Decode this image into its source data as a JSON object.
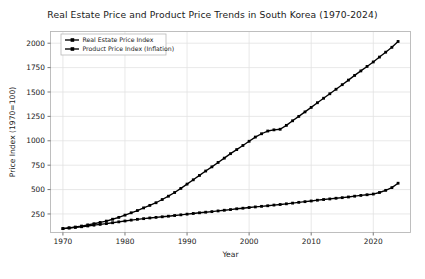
{
  "chart_data": {
    "type": "line",
    "title": "Real Estate Price and Product Price Trends in South Korea (1970-2024)",
    "xlabel": "Year",
    "ylabel": "Price Index (1970=100)",
    "xlim": [
      1968,
      2026
    ],
    "ylim": [
      60,
      2120
    ],
    "grid": true,
    "legend_position": "upper left",
    "xticks": [
      1970,
      1980,
      1990,
      2000,
      2010,
      2020
    ],
    "xtick_labels": [
      "1970",
      "1980",
      "1990",
      "2000",
      "2010",
      "2020"
    ],
    "yticks": [
      250,
      500,
      750,
      1000,
      1250,
      1500,
      1750,
      2000
    ],
    "ytick_labels": [
      "250",
      "500",
      "750",
      "1000",
      "1250",
      "1500",
      "1750",
      "2000"
    ],
    "x": [
      1970,
      1971,
      1972,
      1973,
      1974,
      1975,
      1976,
      1977,
      1978,
      1979,
      1980,
      1981,
      1982,
      1983,
      1984,
      1985,
      1986,
      1987,
      1988,
      1989,
      1990,
      1991,
      1992,
      1993,
      1994,
      1995,
      1996,
      1997,
      1998,
      1999,
      2000,
      2001,
      2002,
      2003,
      2004,
      2005,
      2006,
      2007,
      2008,
      2009,
      2010,
      2011,
      2012,
      2013,
      2014,
      2015,
      2016,
      2017,
      2018,
      2019,
      2020,
      2021,
      2022,
      2023,
      2024
    ],
    "series": [
      {
        "name": "Real Estate Price Index",
        "color": "#000000",
        "marker": "square",
        "values": [
          100,
          108,
          116,
          126,
          138,
          150,
          163,
          177,
          196,
          215,
          238,
          262,
          285,
          312,
          338,
          365,
          398,
          432,
          470,
          512,
          556,
          600,
          645,
          690,
          733,
          778,
          822,
          868,
          910,
          952,
          995,
          1038,
          1072,
          1100,
          1112,
          1118,
          1158,
          1205,
          1250,
          1296,
          1342,
          1390,
          1436,
          1482,
          1528,
          1575,
          1622,
          1670,
          1716,
          1762,
          1808,
          1858,
          1908,
          1958,
          2018
        ]
      },
      {
        "name": "Product Price Index (Inflation)",
        "color": "#000000",
        "marker": "square",
        "values": [
          100,
          106,
          112,
          119,
          127,
          135,
          143,
          151,
          160,
          169,
          178,
          187,
          195,
          202,
          209,
          215,
          221,
          227,
          234,
          241,
          248,
          255,
          262,
          268,
          274,
          281,
          288,
          295,
          303,
          309,
          316,
          322,
          328,
          334,
          341,
          347,
          354,
          361,
          369,
          376,
          383,
          391,
          398,
          404,
          411,
          417,
          424,
          432,
          440,
          447,
          454,
          470,
          492,
          520,
          565
        ]
      }
    ]
  }
}
